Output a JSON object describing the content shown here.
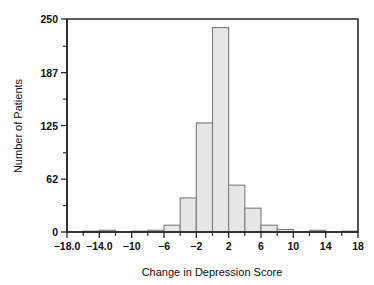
{
  "chart_data": {
    "type": "bar",
    "title": "",
    "subtitle": "",
    "xlabel": "Change in Depression Score",
    "ylabel": "Number of Patients",
    "grid": false,
    "legend": null,
    "legend_position": "none",
    "xlim": [
      -18,
      18
    ],
    "ylim": [
      0,
      250
    ],
    "bin_width": 2,
    "xticklabels": [
      "−18.0",
      "−14.0",
      "−10",
      "−6",
      "−2",
      "2",
      "6",
      "10",
      "14",
      "18"
    ],
    "xtickvalues": [
      -18,
      -14,
      -10,
      -6,
      -2,
      2,
      6,
      10,
      14,
      18
    ],
    "xminortickvalues": [
      -16,
      -12,
      -8,
      -4,
      0,
      4,
      8,
      12,
      16
    ],
    "yticklabels": [
      "0",
      "62",
      "125",
      "187",
      "250"
    ],
    "ytickvalues": [
      0,
      62,
      125,
      187,
      250
    ],
    "yminortickvalues": [
      31,
      93,
      156,
      218
    ],
    "categories": [
      "−18 to −16",
      "−16 to −14",
      "−14 to −12",
      "−12 to −10",
      "−10 to −8",
      "−8 to −6",
      "−6 to −4",
      "−4 to −2",
      "−2 to 0",
      "0 to 2",
      "2 to 4",
      "4 to 6",
      "6 to 8",
      "8 to 10",
      "10 to 12",
      "12 to 14",
      "14 to 16",
      "16 to 18"
    ],
    "bin_starts": [
      -18,
      -16,
      -14,
      -12,
      -10,
      -8,
      -6,
      -4,
      -2,
      0,
      2,
      4,
      6,
      8,
      10,
      12,
      14,
      16
    ],
    "values": [
      0,
      1,
      2,
      0,
      1,
      2,
      8,
      40,
      128,
      240,
      55,
      28,
      8,
      3,
      0,
      2,
      0,
      1
    ],
    "colors": {
      "bar_fill": "#e6e6e6",
      "bar_stroke": "#7d7d7d",
      "axis": "#2b2b2b",
      "text": "#111111",
      "background": "#ffffff"
    }
  }
}
